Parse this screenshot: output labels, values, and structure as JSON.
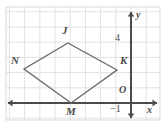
{
  "figure": {
    "kind": "coordinate-plane-geometry-figure",
    "frame": {
      "x": 6,
      "y": 7,
      "width": 154,
      "height": 113,
      "stroke": "#d9d9d9"
    },
    "grid": {
      "visible": true,
      "spacing": 15.2,
      "color": "#e2e2e2",
      "origin_px": {
        "x": 131,
        "y": 103
      }
    },
    "axes": {
      "color": "#4c4c4c",
      "x_axis": {
        "label": "x",
        "label_px": {
          "x": 147,
          "y": 105
        },
        "y_px": 103,
        "from_px": 8,
        "to_px": 157,
        "arrows": "both"
      },
      "y_axis": {
        "label": "y",
        "label_px": {
          "x": 136,
          "y": 10
        },
        "x_px": 131,
        "from_px": 12,
        "to_px": 118,
        "arrows": "both"
      },
      "origin_label": "O",
      "origin_label_px": {
        "x": 119,
        "y": 85
      }
    },
    "ticks": [
      {
        "label": "4",
        "axis": "y",
        "px": {
          "x": 115,
          "y": 33
        }
      },
      {
        "label": "−1",
        "axis": "x",
        "px": {
          "x": 110,
          "y": 104
        }
      }
    ],
    "shape": {
      "name": "rhombus JKMN",
      "stroke": "#6b6b6b",
      "stroke_width": 1.4,
      "fill": "none",
      "vertices": [
        {
          "label": "J",
          "px": {
            "x": 68,
            "y": 43
          },
          "label_px": {
            "x": 62,
            "y": 25
          }
        },
        {
          "label": "K",
          "px": {
            "x": 117,
            "y": 70
          },
          "label_px": {
            "x": 120,
            "y": 55
          }
        },
        {
          "label": "M",
          "px": {
            "x": 71,
            "y": 103
          },
          "label_px": {
            "x": 66,
            "y": 106
          }
        },
        {
          "label": "N",
          "px": {
            "x": 24,
            "y": 69
          },
          "label_px": {
            "x": 11,
            "y": 55
          }
        }
      ]
    }
  }
}
